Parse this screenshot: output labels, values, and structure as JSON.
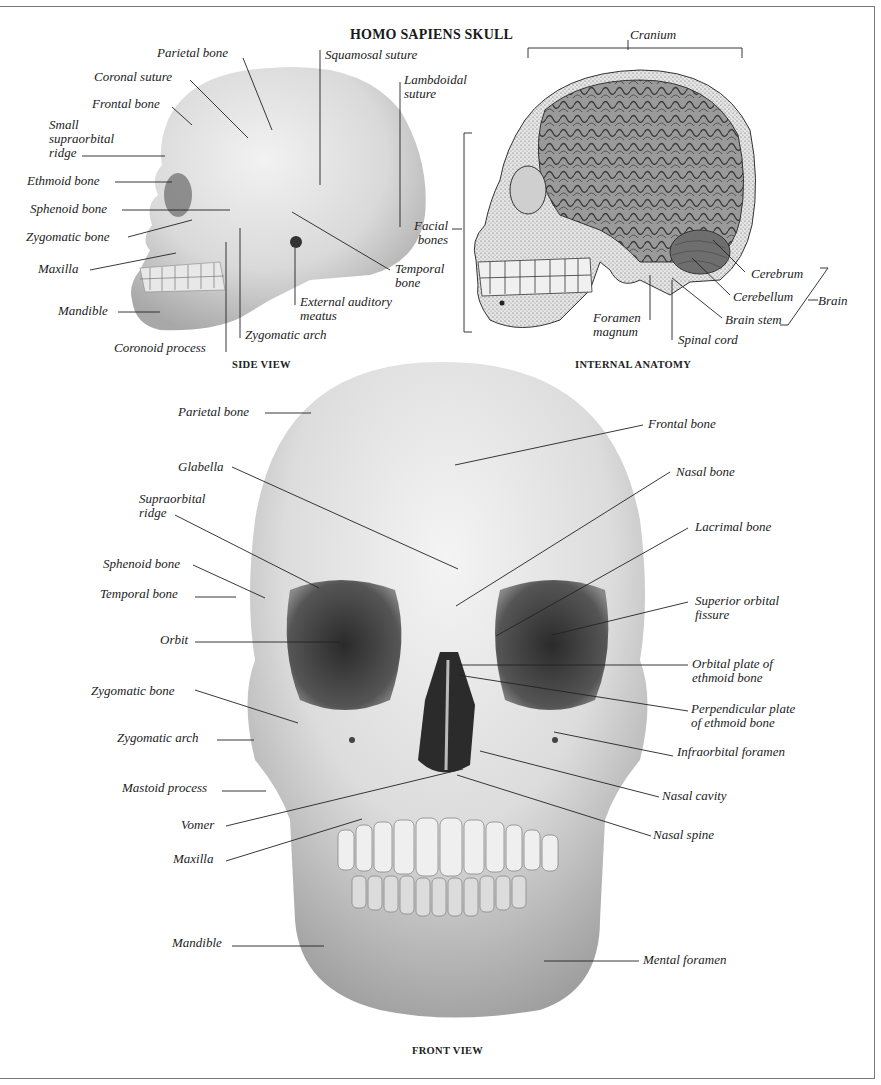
{
  "title": "HOMO SAPIENS SKULL",
  "side_view": {
    "caption": "SIDE VIEW",
    "labels": {
      "parietal_bone": "Parietal bone",
      "squamosal_suture": "Squamosal suture",
      "coronal_suture": "Coronal suture",
      "lambdoidal_suture_1": "Lambdoidal",
      "lambdoidal_suture_2": "suture",
      "frontal_bone": "Frontal bone",
      "small_supraorbital_1": "Small",
      "small_supraorbital_2": "supraorbital",
      "small_supraorbital_3": "ridge",
      "ethmoid_bone": "Ethmoid bone",
      "sphenoid_bone": "Sphenoid bone",
      "zygomatic_bone": "Zygomatic bone",
      "maxilla": "Maxilla",
      "mandible": "Mandible",
      "coronoid_process": "Coronoid process",
      "zygomatic_arch": "Zygomatic arch",
      "external_auditory_1": "External auditory",
      "external_auditory_2": "meatus",
      "temporal_bone_1": "Temporal",
      "temporal_bone_2": "bone"
    }
  },
  "internal_anatomy": {
    "caption": "INTERNAL ANATOMY",
    "labels": {
      "cranium": "Cranium",
      "facial_bones_1": "Facial",
      "facial_bones_2": "bones",
      "cerebrum": "Cerebrum",
      "cerebellum": "Cerebellum",
      "brain": "Brain",
      "brain_stem": "Brain stem",
      "foramen_magnum_1": "Foramen",
      "foramen_magnum_2": "magnum",
      "spinal_cord": "Spinal cord"
    }
  },
  "front_view": {
    "caption": "FRONT VIEW",
    "left_labels": {
      "parietal_bone": "Parietal bone",
      "glabella": "Glabella",
      "supraorbital_1": "Supraorbital",
      "supraorbital_2": "ridge",
      "sphenoid_bone": "Sphenoid bone",
      "temporal_bone": "Temporal bone",
      "orbit": "Orbit",
      "zygomatic_bone": "Zygomatic  bone",
      "zygomatic_arch": "Zygomatic arch",
      "mastoid_process": "Mastoid process",
      "vomer": "Vomer",
      "maxilla": "Maxilla",
      "mandible": "Mandible"
    },
    "right_labels": {
      "frontal_bone": "Frontal bone",
      "nasal_bone": "Nasal bone",
      "lacrimal_bone": "Lacrimal bone",
      "superior_orbital_1": "Superior orbital",
      "superior_orbital_2": "fissure",
      "orbital_plate_1": "Orbital plate of",
      "orbital_plate_2": "ethmoid bone",
      "perpendicular_plate_1": "Perpendicular plate",
      "perpendicular_plate_2": "of ethmoid bone",
      "infraorbital_foramen": "Infraorbital foramen",
      "nasal_cavity": "Nasal cavity",
      "nasal_spine": "Nasal spine",
      "mental_foramen": "Mental foramen"
    }
  }
}
